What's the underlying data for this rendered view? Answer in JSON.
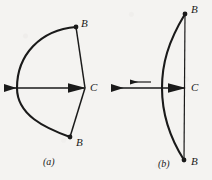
{
  "figure": {
    "caption_a": "(a)",
    "caption_b": "(b)",
    "background_color": "#f4f3f1",
    "ink_color": "#1a1a1a"
  },
  "panel_a": {
    "name": "bow-drawn",
    "labels": {
      "tip_upper": "B",
      "tip_lower": "B",
      "nock": "C"
    },
    "geometry": {
      "bow_tip_upper": [
        76,
        27
      ],
      "bow_tip_lower": [
        70,
        137
      ],
      "bow_belly_x": 17,
      "nock_point": [
        85,
        88
      ],
      "arrow_tail_x": 3,
      "arrow_line_y": 88
    }
  },
  "panel_b": {
    "name": "bow-released",
    "labels": {
      "tip_upper": "B",
      "tip_lower": "B",
      "nock": "C"
    },
    "geometry": {
      "bow_tip_upper": [
        185,
        14
      ],
      "bow_tip_lower": [
        184,
        160
      ],
      "bow_belly_x": 162,
      "string_x": 185,
      "nock_point": [
        185,
        88
      ],
      "arrow_head_x": 110,
      "arrow_line_y": 88,
      "velocity_arrow_from_x": 150,
      "velocity_arrow_to_x": 128,
      "velocity_arrow_y": 82
    }
  }
}
